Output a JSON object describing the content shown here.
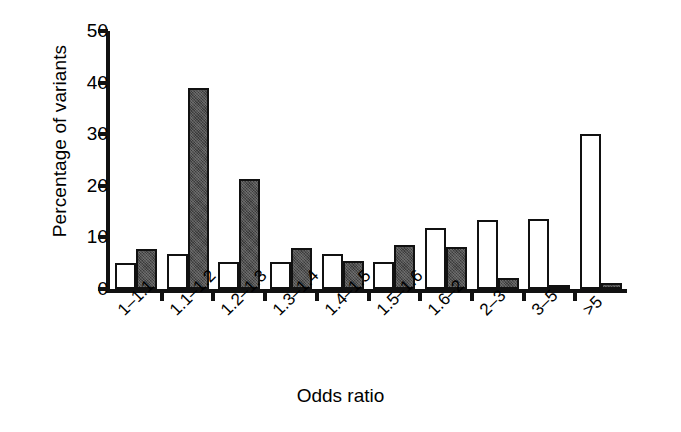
{
  "chart_data": {
    "type": "bar",
    "title": "",
    "xlabel": "Odds ratio",
    "ylabel": "Percentage of variants",
    "categories": [
      "1–1.1",
      "1.1–1.2",
      "1.2–1.3",
      "1.3–1.4",
      "1.4–1.5",
      "1.5–1.6",
      "1.6–2",
      "2–3",
      "3–5",
      ">5"
    ],
    "series": [
      {
        "name": "open",
        "style": "open",
        "color": "#ffffff",
        "values": [
          5,
          6.7,
          5.2,
          5.2,
          6.7,
          5.2,
          11.8,
          13.4,
          13.5,
          30
        ]
      },
      {
        "name": "filled",
        "style": "filled",
        "color": "#3b3b3b",
        "values": [
          7.8,
          39,
          21.4,
          8,
          5.4,
          8.5,
          8.2,
          2.2,
          0.6,
          1.1
        ]
      }
    ],
    "ylim": [
      0,
      50
    ],
    "yticks": [
      0,
      10,
      20,
      30,
      40,
      50
    ],
    "ytick_labels": [
      "0",
      "10",
      "20",
      "30",
      "40",
      "50"
    ],
    "grid": false,
    "legend": "none",
    "axis_color": "#111111"
  }
}
